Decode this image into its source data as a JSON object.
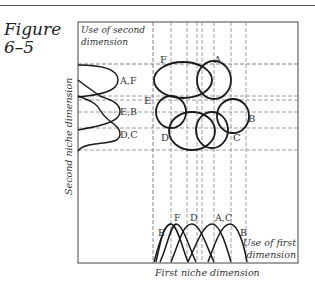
{
  "figure": {
    "label_line1": "Figure",
    "label_line2": "6–5"
  },
  "diagram": {
    "corner_label_line1": "Use of second",
    "corner_label_line2": "dimension",
    "y_axis_label": "Second niche dimension",
    "x_axis_label": "First niche dimension",
    "bottom_right_label_line1": "Use of first",
    "bottom_right_label_line2": "dimension",
    "niche_labels": {
      "A": "A",
      "B": "B",
      "C": "C",
      "D": "D",
      "E": "E",
      "F": "F"
    },
    "second_dimension_curves": [
      "A,F",
      "E,B",
      "D,C"
    ],
    "first_dimension_curves": [
      "E",
      "F",
      "D",
      "A,C",
      "B"
    ]
  }
}
